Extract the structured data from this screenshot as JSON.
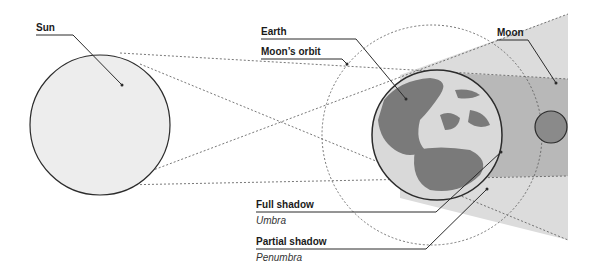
{
  "diagram": {
    "labels": {
      "sun": "Sun",
      "earth": "Earth",
      "moons_orbit": "Moon’s orbit",
      "moon": "Moon",
      "full_shadow": "Full shadow",
      "umbra": "Umbra",
      "partial_shadow": "Partial shadow",
      "penumbra": "Penumbra"
    },
    "colors": {
      "sun_fill": "#ededed",
      "earth_ocean": "#d9d9d9",
      "earth_land": "#7a7a7a",
      "moon_fill": "#8a8a8a",
      "umbra": "#b8b8b8",
      "penumbra": "#dcdcdc",
      "outline": "#2b2b2b"
    }
  }
}
